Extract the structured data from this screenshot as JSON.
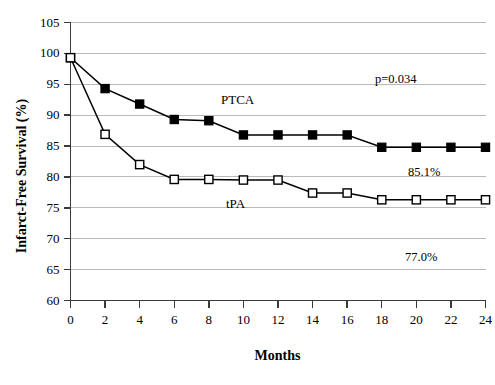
{
  "chart_data": {
    "type": "line",
    "title": "",
    "xlabel": "Months",
    "ylabel": "Infarct-Free Survival (%)",
    "xlim": [
      0,
      24
    ],
    "ylim": [
      60,
      105
    ],
    "xticks": [
      0,
      2,
      4,
      6,
      8,
      10,
      12,
      14,
      16,
      18,
      20,
      22,
      24
    ],
    "yticks": [
      60,
      65,
      70,
      75,
      80,
      85,
      90,
      95,
      100,
      105
    ],
    "grid": "horizontal",
    "legend_position": "inline-annotation",
    "x": [
      0,
      2,
      4,
      6,
      8,
      10,
      12,
      14,
      16,
      18,
      20,
      22,
      24
    ],
    "series": [
      {
        "name": "PTCA",
        "marker": "filled-square",
        "color": "#000000",
        "values": [
          99.3,
          94.3,
          91.8,
          89.3,
          89.1,
          86.8,
          86.8,
          86.8,
          86.8,
          84.8,
          84.8,
          84.8,
          84.8
        ]
      },
      {
        "name": "tPA",
        "marker": "open-square",
        "color": "#000000",
        "values": [
          99.3,
          86.9,
          82.0,
          79.6,
          79.6,
          79.5,
          79.5,
          77.4,
          77.4,
          76.3,
          76.3,
          76.3,
          76.3
        ]
      }
    ],
    "annotations": [
      {
        "text": "p=0.034",
        "x_px": 375,
        "y_px": 72
      },
      {
        "text": "85.1%",
        "x_px": 408,
        "y_px": 165
      },
      {
        "text": "77.0%",
        "x_px": 405,
        "y_px": 250
      },
      {
        "text": "PTCA",
        "x_px": 221,
        "y_px": 92
      },
      {
        "text": "tPA",
        "x_px": 226,
        "y_px": 196
      }
    ]
  },
  "axes": {
    "y_title": "Infarct-Free Survival (%)",
    "x_title": "Months",
    "y_tick_labels": [
      "105",
      "100",
      "95",
      "90",
      "85",
      "80",
      "75",
      "70",
      "65",
      "60"
    ],
    "x_tick_labels": [
      "0",
      "2",
      "4",
      "6",
      "8",
      "10",
      "12",
      "14",
      "16",
      "18",
      "20",
      "22",
      "24"
    ]
  },
  "annotations": {
    "p_value": "p=0.034",
    "ptca_final": "85.1%",
    "tpa_final": "77.0%",
    "ptca_label": "PTCA",
    "tpa_label": "tPA"
  },
  "colors": {
    "line": "#000000",
    "grid": "#b9b9b9",
    "axis": "#3a3a3a",
    "background": "#ffffff"
  }
}
